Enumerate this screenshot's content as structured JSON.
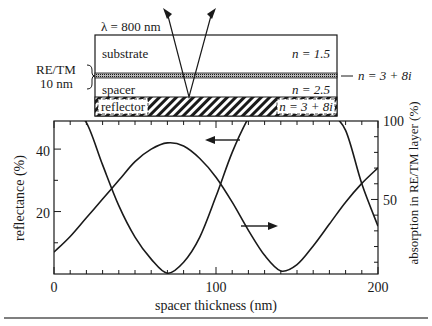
{
  "diagram": {
    "wavelength_label": "λ = 800 nm",
    "layers": [
      {
        "name": "substrate",
        "label": "substrate",
        "index": "n = 1.5"
      },
      {
        "name": "re-tm",
        "label": "RE/TM",
        "thickness": "10 nm",
        "index": "n = 3 + 8i"
      },
      {
        "name": "spacer",
        "label": "spacer",
        "index": "n = 2.5"
      },
      {
        "name": "reflector",
        "label": "reflector",
        "index": "n = 3 + 8i"
      }
    ],
    "bracket_label_line1": "RE/TM",
    "bracket_label_line2": "10 nm"
  },
  "chart_data": {
    "type": "line",
    "title": "",
    "xlabel": "spacer thickness (nm)",
    "ylabel": "reflectance (%)",
    "y2label": "absorption in RE/TM layer (%)",
    "xlim": [
      0,
      200
    ],
    "ylim": [
      0,
      49
    ],
    "y2lim": [
      2.5,
      100
    ],
    "x_ticks": [
      "0",
      "100",
      "200"
    ],
    "y_ticks": [
      "20",
      "40"
    ],
    "y2_ticks": [
      "50",
      "100"
    ],
    "grid": false,
    "legend": "arrows: left arrow marks reflectance curve (left axis), right arrow marks absorption curve (right axis)",
    "x": [
      0,
      10,
      20,
      30,
      40,
      50,
      60,
      70,
      80,
      90,
      100,
      110,
      120,
      130,
      140,
      150,
      160,
      170,
      180,
      190,
      200
    ],
    "series": [
      {
        "name": "reflectance (%)",
        "axis": "left",
        "values": [
          7,
          12,
          18,
          24,
          30,
          36,
          40,
          42,
          41,
          37,
          31,
          23,
          14,
          6,
          1,
          3,
          9,
          16,
          23,
          29,
          34
        ]
      },
      {
        "name": "absorption in RE/TM layer (%)",
        "axis": "right",
        "values": [
          130,
          108,
          99,
          72,
          46,
          26,
          12,
          3,
          10,
          26,
          52,
          80,
          102,
          118,
          128,
          124,
          116,
          106,
          94,
          60,
          33
        ]
      }
    ]
  },
  "labels": {
    "xlabel": "spacer thickness (nm)",
    "ylabel": "reflectance (%)",
    "y2label": "absorption in RE/TM layer (%)",
    "x0": "0",
    "x100": "100",
    "x200": "200",
    "y20": "20",
    "y40": "40",
    "y2_50": "50",
    "y2_100": "100"
  }
}
